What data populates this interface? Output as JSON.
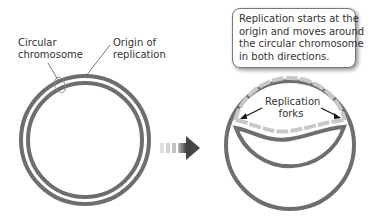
{
  "labels": {
    "circular_chromosome": [
      "Circular",
      "chromosome"
    ],
    "origin_of_replication": [
      "Origin of",
      "replication"
    ],
    "replication_forks": [
      "Replication",
      "forks"
    ]
  },
  "callout": {
    "lines": [
      "Replication starts at the",
      "origin and moves around",
      "the circular chromosome",
      "in both directions."
    ]
  },
  "colors": {
    "dna_strand": "#6e6e6e",
    "new_strand": "#c8c8c8",
    "text": "#333333",
    "arrow": "#555555"
  }
}
